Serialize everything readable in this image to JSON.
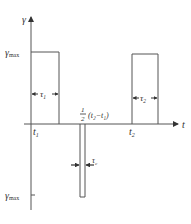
{
  "diagram": {
    "axes": {
      "y_label": "γ",
      "x_label": "t"
    },
    "levels": {
      "top_label": "γ",
      "top_sub": "max",
      "bottom_label": "γ",
      "bottom_sub": "max"
    },
    "time_marks": {
      "t1_main": "t",
      "t1_sub": "1",
      "t2_main": "t",
      "t2_sub": "2"
    },
    "pulses": {
      "pulse1_width_main": "τ",
      "pulse1_width_sub": "1",
      "pulse2_width_main": "τ",
      "pulse2_width_sub": "2",
      "negative_pulse_width_main": "τ",
      "negative_pulse_width_sub": "c"
    },
    "midpoint_label": {
      "frac_num": "1",
      "frac_den": "2",
      "expr": "(t₂−t₁)"
    },
    "colors": {
      "line": "#555555",
      "text": "#333333"
    }
  }
}
